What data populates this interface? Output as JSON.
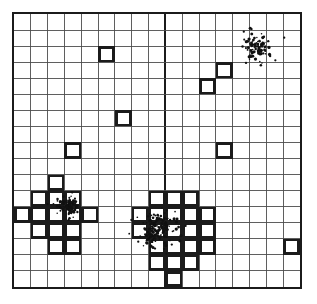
{
  "figure": {
    "title": "",
    "background_color": "#ffffff",
    "frame_color": "#1b1b1b",
    "grid_color": "#4a4a4a",
    "highlight_color": "#1b1b1b",
    "point_color": "#111111"
  },
  "chart_data": {
    "type": "scatter",
    "title": "",
    "subtitle": "",
    "xlabel": "",
    "ylabel": "",
    "xlim": [
      0,
      17
    ],
    "ylim": [
      0,
      17
    ],
    "grid": true,
    "legend": "none",
    "annotations": [],
    "xtick_labels": [],
    "ytick_labels": [],
    "grid_columns": 17,
    "grid_rows": 17,
    "cell_size_px": 17.05,
    "major_divider_columns": [
      9
    ],
    "major_divider_rows": [],
    "highlighted_cells": [
      {
        "col": 5,
        "row": 2
      },
      {
        "col": 12,
        "row": 3
      },
      {
        "col": 11,
        "row": 4
      },
      {
        "col": 6,
        "row": 6
      },
      {
        "col": 3,
        "row": 8
      },
      {
        "col": 12,
        "row": 8
      },
      {
        "col": 2,
        "row": 10
      },
      {
        "col": 1,
        "row": 11
      },
      {
        "col": 2,
        "row": 11
      },
      {
        "col": 3,
        "row": 11
      },
      {
        "col": 0,
        "row": 12
      },
      {
        "col": 1,
        "row": 12
      },
      {
        "col": 2,
        "row": 12
      },
      {
        "col": 3,
        "row": 12
      },
      {
        "col": 4,
        "row": 12
      },
      {
        "col": 1,
        "row": 13
      },
      {
        "col": 2,
        "row": 13
      },
      {
        "col": 3,
        "row": 13
      },
      {
        "col": 2,
        "row": 14
      },
      {
        "col": 3,
        "row": 14
      },
      {
        "col": 8,
        "row": 11
      },
      {
        "col": 9,
        "row": 11
      },
      {
        "col": 10,
        "row": 11
      },
      {
        "col": 7,
        "row": 12
      },
      {
        "col": 8,
        "row": 12
      },
      {
        "col": 9,
        "row": 12
      },
      {
        "col": 10,
        "row": 12
      },
      {
        "col": 11,
        "row": 12
      },
      {
        "col": 7,
        "row": 13
      },
      {
        "col": 8,
        "row": 13
      },
      {
        "col": 9,
        "row": 13
      },
      {
        "col": 10,
        "row": 13
      },
      {
        "col": 11,
        "row": 13
      },
      {
        "col": 8,
        "row": 14
      },
      {
        "col": 9,
        "row": 14
      },
      {
        "col": 10,
        "row": 14
      },
      {
        "col": 11,
        "row": 14
      },
      {
        "col": 8,
        "row": 15
      },
      {
        "col": 9,
        "row": 15
      },
      {
        "col": 10,
        "row": 15
      },
      {
        "col": 16,
        "row": 14
      },
      {
        "col": 9,
        "row": 16
      }
    ],
    "clusters": [
      {
        "name": "cluster-top-right",
        "center_px": [
          258,
          45
        ],
        "n_points": 96,
        "spread_px": 11,
        "seed": 17
      },
      {
        "name": "cluster-left",
        "center_px": [
          67,
          207
        ],
        "n_points": 88,
        "spread_px": 9,
        "seed": 43
      },
      {
        "name": "cluster-center",
        "center_px": [
          158,
          230
        ],
        "n_points": 150,
        "spread_px": 15,
        "seed": 91
      }
    ],
    "outlier_points_px": [
      [
        71,
        193
      ],
      [
        46,
        205
      ],
      [
        286,
        36
      ],
      [
        277,
        59
      ],
      [
        245,
        30
      ],
      [
        131,
        221
      ],
      [
        186,
        227
      ],
      [
        172,
        246
      ],
      [
        155,
        250
      ],
      [
        138,
        243
      ]
    ]
  }
}
